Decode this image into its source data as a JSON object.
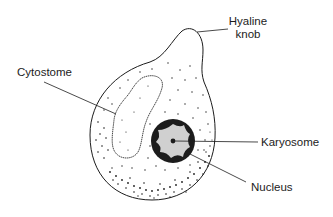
{
  "diagram": {
    "labels": {
      "hyaline_knob_line1": "Hyaline",
      "hyaline_knob_line2": "knob",
      "cytostome": "Cytostome",
      "karyosome": "Karyosome",
      "nucleus": "Nucleus"
    },
    "colors": {
      "stroke": "#1c1c1c",
      "nucleus_fill": "#d0d0d0",
      "background": "#ffffff"
    }
  }
}
